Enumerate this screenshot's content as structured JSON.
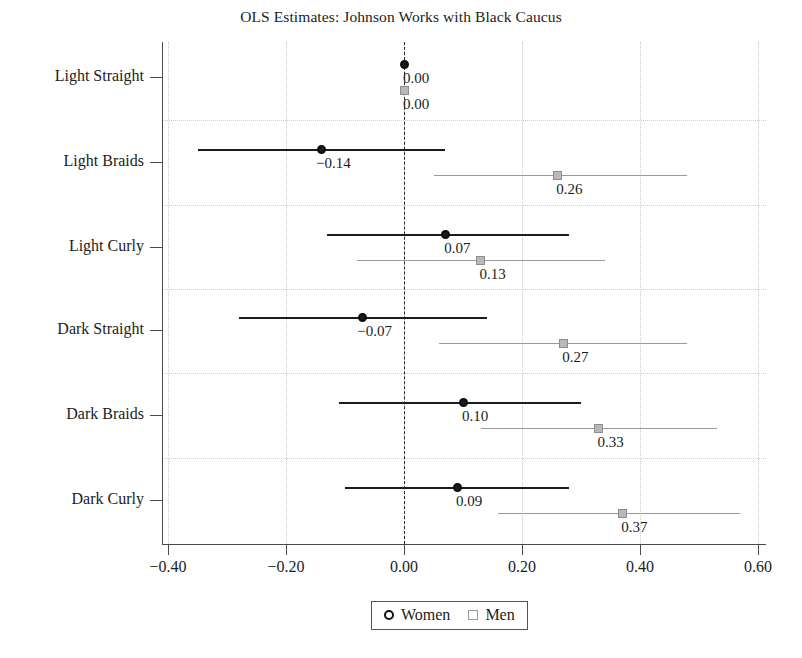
{
  "chart_data": {
    "type": "scatter",
    "title": "OLS Estimates: Johnson Works with Black Caucus",
    "xlabel": "",
    "ylabel": "",
    "xlim": [
      -0.45,
      0.63
    ],
    "xticks": [
      -0.4,
      -0.2,
      0.0,
      0.2,
      0.4,
      0.6
    ],
    "xticklabels": [
      "−0.40",
      "−0.20",
      "0.00",
      "0.20",
      "0.40",
      "0.60"
    ],
    "categories": [
      "Light Straight",
      "Light Braids",
      "Light Curly",
      "Dark Straight",
      "Dark Braids",
      "Dark Curly"
    ],
    "grid": true,
    "reference_line": 0.0,
    "legend_position": "bottom-center",
    "series": [
      {
        "name": "Women",
        "marker": "circle",
        "color": "#1c1c1c",
        "values": [
          0.0,
          -0.14,
          0.07,
          -0.07,
          0.1,
          0.09
        ],
        "labels": [
          "0.00",
          "−0.14",
          "0.07",
          "−0.07",
          "0.10",
          "0.09"
        ],
        "ci_low": [
          0.0,
          -0.35,
          -0.13,
          -0.28,
          -0.11,
          -0.1
        ],
        "ci_high": [
          0.0,
          0.07,
          0.28,
          0.14,
          0.3,
          0.28
        ]
      },
      {
        "name": "Men",
        "marker": "square",
        "color": "#9a9a9a",
        "values": [
          0.0,
          0.26,
          0.13,
          0.27,
          0.33,
          0.37
        ],
        "labels": [
          "0.00",
          "0.26",
          "0.13",
          "0.27",
          "0.33",
          "0.37"
        ],
        "ci_low": [
          0.0,
          0.05,
          -0.08,
          0.06,
          0.13,
          0.16
        ],
        "ci_high": [
          0.0,
          0.48,
          0.34,
          0.48,
          0.53,
          0.57
        ]
      }
    ]
  },
  "legend": {
    "items": [
      {
        "label": "Women",
        "marker": "circle"
      },
      {
        "label": "Men",
        "marker": "square"
      }
    ]
  }
}
